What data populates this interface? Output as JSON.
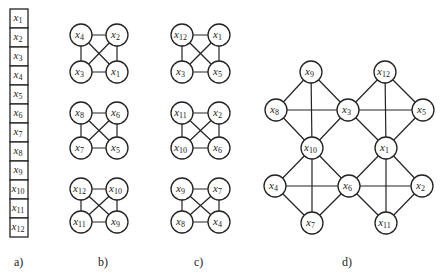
{
  "colors": {
    "stroke": "#222222",
    "background": "#ffffff"
  },
  "panels": {
    "a": {
      "label": "a)",
      "cells": [
        "1",
        "2",
        "3",
        "4",
        "5",
        "6",
        "7",
        "8",
        "9",
        "10",
        "11",
        "12"
      ]
    },
    "b": {
      "label": "b)",
      "groups": [
        {
          "tl": "4",
          "tr": "2",
          "bl": "3",
          "br": "1"
        },
        {
          "tl": "8",
          "tr": "6",
          "bl": "7",
          "br": "5"
        },
        {
          "tl": "12",
          "tr": "10",
          "bl": "11",
          "br": "9"
        }
      ]
    },
    "c": {
      "label": "c)",
      "groups": [
        {
          "tl": "12",
          "tr": "1",
          "bl": "3",
          "br": "5"
        },
        {
          "tl": "11",
          "tr": "2",
          "bl": "10",
          "br": "6"
        },
        {
          "tl": "9",
          "tr": "7",
          "bl": "8",
          "br": "4"
        }
      ]
    },
    "d": {
      "label": "d)",
      "nodes": [
        {
          "id": "9",
          "x": 311,
          "y": 72
        },
        {
          "id": "12",
          "x": 385,
          "y": 72
        },
        {
          "id": "8",
          "x": 276,
          "y": 110
        },
        {
          "id": "3",
          "x": 348,
          "y": 110
        },
        {
          "id": "5",
          "x": 423,
          "y": 110
        },
        {
          "id": "10",
          "x": 312,
          "y": 148
        },
        {
          "id": "1",
          "x": 386,
          "y": 148
        },
        {
          "id": "4",
          "x": 275,
          "y": 186
        },
        {
          "id": "6",
          "x": 349,
          "y": 186
        },
        {
          "id": "2",
          "x": 422,
          "y": 186
        },
        {
          "id": "7",
          "x": 312,
          "y": 223
        },
        {
          "id": "11",
          "x": 386,
          "y": 223
        }
      ],
      "edges": [
        [
          "9",
          "8"
        ],
        [
          "9",
          "3"
        ],
        [
          "9",
          "10"
        ],
        [
          "8",
          "3"
        ],
        [
          "8",
          "10"
        ],
        [
          "3",
          "10"
        ],
        [
          "12",
          "3"
        ],
        [
          "12",
          "5"
        ],
        [
          "12",
          "1"
        ],
        [
          "3",
          "5"
        ],
        [
          "3",
          "1"
        ],
        [
          "5",
          "1"
        ],
        [
          "10",
          "4"
        ],
        [
          "10",
          "6"
        ],
        [
          "10",
          "7"
        ],
        [
          "4",
          "6"
        ],
        [
          "4",
          "7"
        ],
        [
          "6",
          "7"
        ],
        [
          "1",
          "6"
        ],
        [
          "1",
          "2"
        ],
        [
          "1",
          "11"
        ],
        [
          "6",
          "2"
        ],
        [
          "6",
          "11"
        ],
        [
          "2",
          "11"
        ]
      ]
    }
  }
}
